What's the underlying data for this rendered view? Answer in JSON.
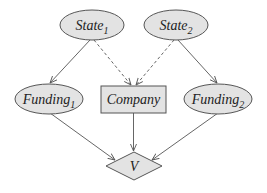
{
  "diagram": {
    "type": "influence-diagram",
    "nodes": [
      {
        "id": "state1",
        "label": "State",
        "subscript": "1",
        "shape": "ellipse",
        "kind": "chance"
      },
      {
        "id": "state2",
        "label": "State",
        "subscript": "2",
        "shape": "ellipse",
        "kind": "chance"
      },
      {
        "id": "funding1",
        "label": "Funding",
        "subscript": "1",
        "shape": "ellipse",
        "kind": "chance"
      },
      {
        "id": "company",
        "label": "Company",
        "subscript": "",
        "shape": "rectangle",
        "kind": "decision"
      },
      {
        "id": "funding2",
        "label": "Funding",
        "subscript": "2",
        "shape": "ellipse",
        "kind": "chance"
      },
      {
        "id": "v",
        "label": "V",
        "subscript": "",
        "shape": "diamond",
        "kind": "utility"
      }
    ],
    "edges": [
      {
        "from": "state1",
        "to": "funding1",
        "style": "solid"
      },
      {
        "from": "state1",
        "to": "company",
        "style": "dashed"
      },
      {
        "from": "state2",
        "to": "company",
        "style": "dashed"
      },
      {
        "from": "state2",
        "to": "funding2",
        "style": "solid"
      },
      {
        "from": "funding1",
        "to": "v",
        "style": "solid"
      },
      {
        "from": "company",
        "to": "v",
        "style": "solid"
      },
      {
        "from": "funding2",
        "to": "v",
        "style": "solid"
      }
    ],
    "colors": {
      "node_fill": "#e3e3e3",
      "stroke": "#555555",
      "text": "#222222"
    }
  }
}
